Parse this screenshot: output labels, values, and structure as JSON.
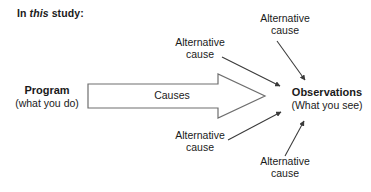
{
  "heading": {
    "prefix": "In ",
    "emphasis": "this",
    "suffix": " study:"
  },
  "program": {
    "title": "Program",
    "subtitle": "(what you do)"
  },
  "observations": {
    "title": "Observations",
    "subtitle": "(What you see)"
  },
  "causes_arrow": {
    "label": "Causes"
  },
  "alternative_causes": [
    {
      "id": "top-left",
      "line1": "Alternative",
      "line2": "cause"
    },
    {
      "id": "top-right",
      "line1": "Alternative",
      "line2": "cause"
    },
    {
      "id": "bottom-left",
      "line1": "Alternative",
      "line2": "cause"
    },
    {
      "id": "bottom-right",
      "line1": "Alternative",
      "line2": "cause"
    }
  ],
  "colors": {
    "text": "#1a1a1a",
    "arrow_outline": "#6e6e6e",
    "arrow_fill": "#ffffff",
    "thin_arrow": "#3a3a3a",
    "background": "#ffffff"
  }
}
